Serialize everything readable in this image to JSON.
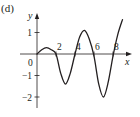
{
  "panel": {
    "label": "(d)"
  },
  "chart_data": {
    "type": "line",
    "title": "",
    "xlabel": "x",
    "ylabel": "y",
    "xlim": [
      0,
      9.3
    ],
    "ylim": [
      -2.5,
      1.8
    ],
    "grid": false,
    "legend": null,
    "x_ticks": [
      2,
      4,
      6,
      8
    ],
    "x_tick_labels": [
      "2",
      "4",
      "6",
      "8"
    ],
    "y_ticks": [
      1,
      -1,
      -2
    ],
    "y_tick_labels": [
      "1",
      "−1",
      "−2"
    ],
    "origin_label": "0",
    "series": [
      {
        "name": "f(x)",
        "x": [
          0,
          0.5,
          1,
          1.5,
          2,
          2.5,
          3,
          3.5,
          4,
          4.5,
          5,
          5.5,
          6,
          6.5,
          7,
          7.5,
          8,
          8.5,
          9
        ],
        "values": [
          0,
          0.2,
          0.3,
          0.2,
          0,
          -0.9,
          -1.4,
          -0.9,
          0,
          0.8,
          1.1,
          0.7,
          -0.1,
          -1.4,
          -2.0,
          -1.3,
          -0.1,
          0.9,
          1.6
        ]
      }
    ]
  },
  "colors": {
    "ink": "#231f20",
    "background": "#ffffff"
  }
}
